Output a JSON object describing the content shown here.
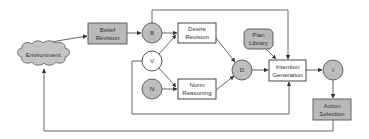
{
  "diagram": {
    "type": "BDI agent architecture flow diagram",
    "colors": {
      "gray_fill": "#b9b9b9",
      "white_fill": "#ffffff",
      "stroke": "#555555",
      "text": "#333333"
    },
    "nodes": {
      "environment": {
        "label": "Environment",
        "shape": "cloud"
      },
      "belief_revision": {
        "line1": "Belief",
        "line2": "Revision",
        "shape": "gray-box"
      },
      "b": {
        "label": "B",
        "shape": "gray-circle"
      },
      "v": {
        "label": "V",
        "shape": "white-circle"
      },
      "n": {
        "label": "N",
        "shape": "gray-circle"
      },
      "desire_revision": {
        "line1": "Desire",
        "line2": "Revision",
        "shape": "white-box"
      },
      "norm_reasoning": {
        "line1": "Norm",
        "line2": "Reasoning",
        "shape": "white-box"
      },
      "d": {
        "label": "D",
        "shape": "gray-circle"
      },
      "plan_library": {
        "line1": "Plan",
        "line2": "Library",
        "shape": "gray-rounded-box"
      },
      "intention_generation": {
        "line1": "Intention",
        "line2": "Generation",
        "shape": "white-box"
      },
      "i": {
        "label": "I",
        "shape": "gray-circle"
      },
      "action_selection": {
        "line1": "Action",
        "line2": "Selection",
        "shape": "gray-box"
      }
    },
    "edges": [
      {
        "from": "Environment",
        "to": "Belief Revision"
      },
      {
        "from": "Belief Revision",
        "to": "B"
      },
      {
        "from": "B",
        "to": "Desire Revision"
      },
      {
        "from": "B",
        "to": "Intention Generation",
        "route": "top"
      },
      {
        "from": "V",
        "to": "Desire Revision"
      },
      {
        "from": "V",
        "to": "Norm Reasoning"
      },
      {
        "from": "V",
        "to": "Intention Generation",
        "route": "bottom-bracket"
      },
      {
        "from": "N",
        "to": "Norm Reasoning"
      },
      {
        "from": "Desire Revision",
        "to": "D"
      },
      {
        "from": "Norm Reasoning",
        "to": "D"
      },
      {
        "from": "D",
        "to": "Intention Generation"
      },
      {
        "from": "Plan Library",
        "to": "Intention Generation"
      },
      {
        "from": "Intention Generation",
        "to": "I"
      },
      {
        "from": "I",
        "to": "Action Selection"
      },
      {
        "from": "Action Selection",
        "to": "Environment",
        "route": "bottom-feedback"
      }
    ]
  }
}
